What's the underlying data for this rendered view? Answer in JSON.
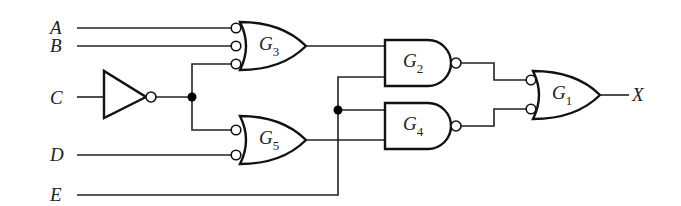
{
  "diagram": {
    "type": "logic-circuit",
    "inputs": [
      {
        "id": "A",
        "label": "A"
      },
      {
        "id": "B",
        "label": "B"
      },
      {
        "id": "C",
        "label": "C"
      },
      {
        "id": "D",
        "label": "D"
      },
      {
        "id": "E",
        "label": "E"
      }
    ],
    "output": {
      "id": "X",
      "label": "X"
    },
    "gates": [
      {
        "id": "G3",
        "letter": "G",
        "sub": "3",
        "kind": "OR with inverted inputs",
        "inputs": [
          "A'",
          "B'",
          "C (via inverter, then inverted)"
        ]
      },
      {
        "id": "G5",
        "letter": "G",
        "sub": "5",
        "kind": "OR with inverted inputs",
        "inputs": [
          "C (via inverter, then inverted)",
          "D'"
        ]
      },
      {
        "id": "G2",
        "letter": "G",
        "sub": "2",
        "kind": "NAND",
        "inputs": [
          "G3",
          "E"
        ]
      },
      {
        "id": "G4",
        "letter": "G",
        "sub": "4",
        "kind": "NAND",
        "inputs": [
          "E",
          "G5"
        ]
      },
      {
        "id": "G1",
        "letter": "G",
        "sub": "1",
        "kind": "OR with inverted inputs",
        "inputs": [
          "G2'",
          "G4'"
        ]
      }
    ],
    "inverter": {
      "input": "C"
    },
    "colors": {
      "line": "#222222",
      "background": "#ffffff"
    }
  }
}
